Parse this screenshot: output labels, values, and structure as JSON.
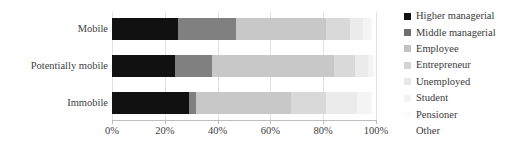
{
  "chart_data": {
    "type": "bar",
    "orientation": "horizontal",
    "stacked": true,
    "normalized_percent": true,
    "title": "",
    "xlabel": "",
    "ylabel": "",
    "xlim": [
      0,
      100
    ],
    "grid": true,
    "grid_axis": "x",
    "legend_position": "right",
    "categories": [
      "Mobile",
      "Potentially mobile",
      "Immobile"
    ],
    "tick_labels": [
      "0%",
      "20%",
      "40%",
      "60%",
      "80%",
      "100%"
    ],
    "tick_values": [
      0,
      20,
      40,
      60,
      80,
      100
    ],
    "series": [
      {
        "name": "Higher managerial",
        "color": "#111111",
        "values": [
          25,
          24,
          29
        ]
      },
      {
        "name": "Middle managerial",
        "color": "#808080",
        "values": [
          22,
          14,
          3
        ]
      },
      {
        "name": "Employee",
        "color": "#c8c8c8",
        "values": [
          34,
          46,
          36
        ]
      },
      {
        "name": "Entrepreneur",
        "color": "#d9d9d9",
        "values": [
          9,
          8,
          13
        ]
      },
      {
        "name": "Unemployed",
        "color": "#ebebeb",
        "values": [
          5,
          5,
          12
        ]
      },
      {
        "name": "Student",
        "color": "#f4f4f4",
        "values": [
          3,
          2,
          5
        ]
      },
      {
        "name": "Pensioner",
        "color": "#fbfbfb",
        "values": [
          1,
          1,
          1
        ]
      },
      {
        "name": "Other",
        "color": "#ffffff",
        "values": [
          1,
          0,
          1
        ]
      }
    ]
  },
  "legend": {
    "items": [
      {
        "label": "Higher managerial",
        "color": "#111111"
      },
      {
        "label": "Middle managerial",
        "color": "#6e6e6e"
      },
      {
        "label": "Employee",
        "color": "#c2c2c2"
      },
      {
        "label": "Entrepreneur",
        "color": "#d4d4d4"
      },
      {
        "label": "Unemployed",
        "color": "#e8e8e8"
      },
      {
        "label": "Student",
        "color": "#f2f2f2"
      },
      {
        "label": "Pensioner",
        "color": "#fcfcfc"
      },
      {
        "label": "Other",
        "color": "#ffffff"
      }
    ]
  },
  "axis": {
    "x_ticks": [
      "0%",
      "20%",
      "40%",
      "60%",
      "80%",
      "100%"
    ],
    "y_ticks": [
      "Mobile",
      "Potentially mobile",
      "Immobile"
    ]
  },
  "colors": {
    "gridline": "#e2e2e2",
    "axis": "#bdbdbd",
    "text": "#404040",
    "background": "#ffffff"
  }
}
